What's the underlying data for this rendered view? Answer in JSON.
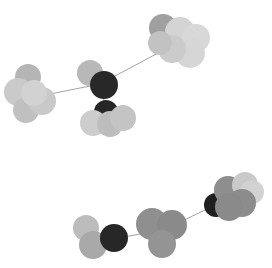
{
  "canvas": {
    "width": 272,
    "height": 268,
    "background": "#ffffff",
    "title": "molecular-structure-render",
    "render_style": "space-filling-overlapping-spheres",
    "colorway": "grayscale"
  },
  "palette": {
    "black": "#1c1c1c",
    "dark_gray": "#4a4a4a",
    "medium_gray": "#8f8f8f",
    "gray": "#a0a0a0",
    "light_gray": "#c6c6c6",
    "lighter_gray": "#d2d2d2",
    "pale_gray": "#dcdcdc",
    "bond": "#9a9a9a"
  },
  "molecules": [
    {
      "name": "molecule-top",
      "bonds": [
        {
          "name": "bond-left-center",
          "x1": 45,
          "y1": 95,
          "x2": 100,
          "y2": 84,
          "color": "#9a9a9a",
          "width": 0.9
        },
        {
          "name": "bond-center-right",
          "x1": 100,
          "y1": 84,
          "x2": 175,
          "y2": 44,
          "color": "#9a9a9a",
          "width": 0.9
        },
        {
          "name": "bond-center-down",
          "x1": 103,
          "y1": 92,
          "x2": 105,
          "y2": 112,
          "color": "#9a9a9a",
          "width": 0.9
        }
      ],
      "atoms": [
        {
          "name": "atom-left-a",
          "cx": 28,
          "cy": 77,
          "r": 13,
          "color": "#b5b5b5"
        },
        {
          "name": "atom-left-b",
          "cx": 18,
          "cy": 92,
          "r": 14,
          "color": "#cacaca"
        },
        {
          "name": "atom-left-c",
          "cx": 26,
          "cy": 110,
          "r": 13,
          "color": "#c0c0c0"
        },
        {
          "name": "atom-left-d",
          "cx": 42,
          "cy": 101,
          "r": 14,
          "color": "#c9c9c9"
        },
        {
          "name": "atom-left-e",
          "cx": 34,
          "cy": 93,
          "r": 13,
          "color": "#d2d2d2"
        },
        {
          "name": "atom-center-top",
          "cx": 90,
          "cy": 73,
          "r": 13,
          "color": "#b8b8b8"
        },
        {
          "name": "atom-center-dark",
          "cx": 104,
          "cy": 85,
          "r": 14,
          "color": "#282828"
        },
        {
          "name": "atom-lower-dark",
          "cx": 106,
          "cy": 112,
          "r": 12,
          "color": "#262626"
        },
        {
          "name": "atom-lower-left",
          "cx": 93,
          "cy": 123,
          "r": 13,
          "color": "#cdcdcd"
        },
        {
          "name": "atom-lower-mid",
          "cx": 110,
          "cy": 124,
          "r": 13,
          "color": "#bdbdbd"
        },
        {
          "name": "atom-lower-right",
          "cx": 123,
          "cy": 118,
          "r": 13,
          "color": "#c4c4c4"
        },
        {
          "name": "atom-right-dark",
          "cx": 163,
          "cy": 28,
          "r": 14,
          "color": "#a0a0a0"
        },
        {
          "name": "atom-right-a",
          "cx": 180,
          "cy": 32,
          "r": 15,
          "color": "#d4d4d4"
        },
        {
          "name": "atom-right-b",
          "cx": 196,
          "cy": 38,
          "r": 14,
          "color": "#d8d8d8"
        },
        {
          "name": "atom-right-c",
          "cx": 190,
          "cy": 53,
          "r": 15,
          "color": "#d6d6d6"
        },
        {
          "name": "atom-right-d",
          "cx": 172,
          "cy": 49,
          "r": 14,
          "color": "#cbcbcb"
        },
        {
          "name": "atom-right-e",
          "cx": 160,
          "cy": 43,
          "r": 12,
          "color": "#c2c2c2"
        }
      ]
    },
    {
      "name": "molecule-bottom",
      "bonds": [
        {
          "name": "bond-left-mid",
          "x1": 118,
          "y1": 238,
          "x2": 152,
          "y2": 232,
          "color": "#9a9a9a",
          "width": 0.9
        },
        {
          "name": "bond-mid-right",
          "x1": 168,
          "y1": 228,
          "x2": 215,
          "y2": 205,
          "color": "#9a9a9a",
          "width": 0.9
        }
      ],
      "atoms": [
        {
          "name": "atom-b-left-a",
          "cx": 86,
          "cy": 228,
          "r": 13,
          "color": "#bcbcbc"
        },
        {
          "name": "atom-b-left-b",
          "cx": 93,
          "cy": 245,
          "r": 14,
          "color": "#a9a9a9"
        },
        {
          "name": "atom-b-dark",
          "cx": 114,
          "cy": 238,
          "r": 14,
          "color": "#272727"
        },
        {
          "name": "atom-b-mid-a",
          "cx": 152,
          "cy": 224,
          "r": 16,
          "color": "#8f8f8f"
        },
        {
          "name": "atom-b-mid-b",
          "cx": 172,
          "cy": 225,
          "r": 15,
          "color": "#8a8a8a"
        },
        {
          "name": "atom-b-mid-c",
          "cx": 162,
          "cy": 244,
          "r": 14,
          "color": "#949494"
        },
        {
          "name": "atom-b-right-dark",
          "cx": 216,
          "cy": 205,
          "r": 12,
          "color": "#1f1f1f"
        },
        {
          "name": "atom-b-right-a",
          "cx": 228,
          "cy": 190,
          "r": 14,
          "color": "#8e8e8e"
        },
        {
          "name": "atom-b-right-b",
          "cx": 245,
          "cy": 185,
          "r": 13,
          "color": "#c9c9c9"
        },
        {
          "name": "atom-b-right-c",
          "cx": 252,
          "cy": 192,
          "r": 12,
          "color": "#d2d2d2"
        },
        {
          "name": "atom-b-right-d",
          "cx": 242,
          "cy": 203,
          "r": 14,
          "color": "#8c8c8c"
        },
        {
          "name": "atom-b-right-e",
          "cx": 229,
          "cy": 207,
          "r": 14,
          "color": "#8a8a8a"
        }
      ]
    }
  ]
}
